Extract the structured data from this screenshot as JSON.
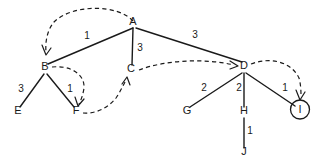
{
  "diagram": {
    "background_color": "#ffffff",
    "stroke_color": "#1a1a1a",
    "nodes": [
      {
        "id": "A",
        "label": "A",
        "x": 133,
        "y": 25,
        "circled": false
      },
      {
        "id": "B",
        "label": "B",
        "x": 45,
        "y": 70,
        "circled": false
      },
      {
        "id": "C",
        "label": "C",
        "x": 131,
        "y": 72,
        "circled": false
      },
      {
        "id": "D",
        "label": "D",
        "x": 244,
        "y": 69,
        "circled": false
      },
      {
        "id": "E",
        "label": "E",
        "x": 18,
        "y": 114,
        "circled": false
      },
      {
        "id": "F",
        "label": "F",
        "x": 76,
        "y": 114,
        "circled": false
      },
      {
        "id": "G",
        "label": "G",
        "x": 187,
        "y": 114,
        "circled": false
      },
      {
        "id": "H",
        "label": "H",
        "x": 244,
        "y": 114,
        "circled": false
      },
      {
        "id": "I",
        "label": "I",
        "x": 300,
        "y": 113,
        "circled": true
      },
      {
        "id": "J",
        "label": "J",
        "x": 244,
        "y": 155,
        "circled": false
      }
    ],
    "edges": [
      {
        "from": "A",
        "to": "B",
        "weight": "1",
        "wx": 87,
        "wy": 39
      },
      {
        "from": "A",
        "to": "C",
        "weight": "3",
        "wx": 140,
        "wy": 51
      },
      {
        "from": "A",
        "to": "D",
        "weight": "3",
        "wx": 195,
        "wy": 38
      },
      {
        "from": "B",
        "to": "E",
        "weight": "3",
        "wx": 21,
        "wy": 92
      },
      {
        "from": "B",
        "to": "F",
        "weight": "1",
        "wx": 70,
        "wy": 92
      },
      {
        "from": "D",
        "to": "G",
        "weight": "2",
        "wx": 204,
        "wy": 91
      },
      {
        "from": "D",
        "to": "H",
        "weight": "2",
        "wx": 239,
        "wy": 91
      },
      {
        "from": "D",
        "to": "I",
        "weight": "1",
        "wx": 285,
        "wy": 91
      },
      {
        "from": "H",
        "to": "J",
        "weight": "1",
        "wx": 250,
        "wy": 134
      }
    ],
    "traversal_arrows": [
      {
        "from": "A",
        "to": "B",
        "name": "dashed-arrow-a-to-b"
      },
      {
        "from": "B",
        "to": "F",
        "name": "dashed-arrow-b-to-f"
      },
      {
        "from": "F",
        "to": "C",
        "name": "dashed-arrow-f-to-c"
      },
      {
        "from": "C",
        "to": "D",
        "name": "dashed-arrow-c-to-d"
      },
      {
        "from": "D",
        "to": "I",
        "name": "dashed-arrow-d-to-i"
      }
    ]
  }
}
